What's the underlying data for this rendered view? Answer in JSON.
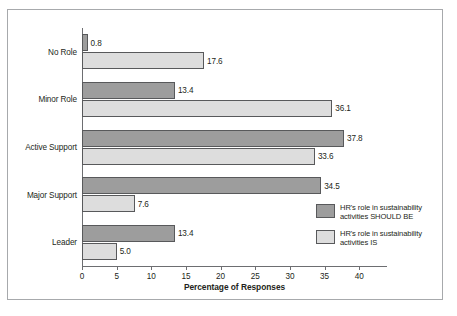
{
  "chart_data": {
    "type": "bar",
    "orientation": "horizontal",
    "title": "",
    "xlabel": "Percentage of Responses",
    "ylabel": "",
    "xlim": [
      0,
      44
    ],
    "grid": false,
    "legend_position": "inside-right",
    "categories": [
      "No Role",
      "Minor Role",
      "Active Support",
      "Major Support",
      "Leader"
    ],
    "series": [
      {
        "name": "HR's role in sustainability activities SHOULD BE",
        "color": "#9d9d9d",
        "values": [
          0.8,
          13.4,
          37.8,
          34.5,
          13.4
        ],
        "value_labels": [
          "0.8",
          "13.4",
          "37.8",
          "34.5",
          "13.4"
        ]
      },
      {
        "name": "HR's role in sustainability activities IS",
        "color": "#dddddd",
        "values": [
          17.6,
          36.1,
          33.6,
          7.6,
          5.0
        ],
        "value_labels": [
          "17.6",
          "36.1",
          "33.6",
          "7.6",
          "5.0"
        ]
      }
    ],
    "ticks": [
      0,
      5,
      10,
      15,
      20,
      25,
      30,
      35,
      40
    ],
    "tick_labels": [
      "0",
      "5",
      "10",
      "15",
      "20",
      "25",
      "30",
      "35",
      "40"
    ]
  },
  "legend": {
    "items": [
      {
        "swatch": "dark",
        "line1": "HR's role in sustainability",
        "line2": "activities SHOULD BE"
      },
      {
        "swatch": "light",
        "line1": "HR's role in sustainability",
        "line2": "activities IS"
      }
    ]
  },
  "axis": {
    "x_title": "Percentage of Responses"
  },
  "caption": {
    "text": ""
  }
}
